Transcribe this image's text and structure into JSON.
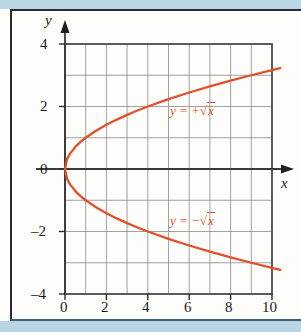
{
  "chart_data": {
    "type": "line",
    "title": "",
    "xlabel": "x",
    "ylabel": "y",
    "xlim": [
      0,
      10
    ],
    "ylim": [
      -4,
      4
    ],
    "grid": true,
    "grid_step_x": 1,
    "grid_step_y": 1,
    "legend_position": "inline-annotation",
    "xticks": [
      0,
      2,
      4,
      6,
      8,
      10
    ],
    "xtick_labels": [
      "0",
      "2",
      "4",
      "6",
      "8",
      "10"
    ],
    "yticks": [
      4,
      2,
      0,
      -2,
      -4
    ],
    "ytick_labels": [
      "4",
      "2",
      "0",
      "-2",
      "-4"
    ],
    "series": [
      {
        "name": "y = +√x",
        "color": "#e0502b",
        "label_text_prefix": "y = +",
        "label_radical": "√",
        "label_radicand": "x",
        "x": [
          0,
          0.1,
          0.25,
          0.5,
          0.75,
          1,
          1.5,
          2,
          2.5,
          3,
          3.5,
          4,
          5,
          6,
          7,
          8,
          9,
          10,
          10.4
        ],
        "values": [
          0,
          0.316,
          0.5,
          0.707,
          0.866,
          1,
          1.225,
          1.414,
          1.581,
          1.732,
          1.871,
          2,
          2.236,
          2.449,
          2.646,
          2.828,
          3,
          3.162,
          3.225
        ]
      },
      {
        "name": "y = -√x",
        "color": "#e0502b",
        "label_text_prefix": "y = −",
        "label_radical": "√",
        "label_radicand": "x",
        "x": [
          0,
          0.1,
          0.25,
          0.5,
          0.75,
          1,
          1.5,
          2,
          2.5,
          3,
          3.5,
          4,
          5,
          6,
          7,
          8,
          9,
          10,
          10.4
        ],
        "values": [
          0,
          -0.316,
          -0.5,
          -0.707,
          -0.866,
          -1,
          -1.225,
          -1.414,
          -1.581,
          -1.732,
          -1.871,
          -2,
          -2.236,
          -2.449,
          -2.646,
          -2.828,
          -3,
          -3.162,
          -3.225
        ]
      }
    ],
    "annotations": [
      {
        "id": "upper-curve-label",
        "text": "y = +√x",
        "x_data": 5.2,
        "y_data": 1.8
      },
      {
        "id": "lower-curve-label",
        "text": "y = −√x",
        "x_data": 5.2,
        "y_data": -1.75
      }
    ],
    "colors": {
      "curve": "#e0502b",
      "grid": "#8a8a8a",
      "axis": "#3a3a3a",
      "frame": "#4a4a4a",
      "background": "#fdfdfb",
      "scan_edge": "#bcd7e4"
    }
  },
  "axes": {
    "y_axis_name": "y",
    "x_axis_name": "x"
  },
  "ticks": {
    "x": [
      {
        "label": "0"
      },
      {
        "label": "2"
      },
      {
        "label": "4"
      },
      {
        "label": "6"
      },
      {
        "label": "8"
      },
      {
        "label": "10"
      }
    ],
    "y": [
      {
        "label": "4"
      },
      {
        "label": "2"
      },
      {
        "label": "0"
      },
      {
        "label": "–2"
      },
      {
        "label": "–4"
      }
    ]
  },
  "labels": {
    "upper": {
      "lead": "y = +",
      "radical": "√",
      "radicand": "x"
    },
    "lower": {
      "lead": "y = −",
      "radical": "√",
      "radicand": "x"
    }
  }
}
